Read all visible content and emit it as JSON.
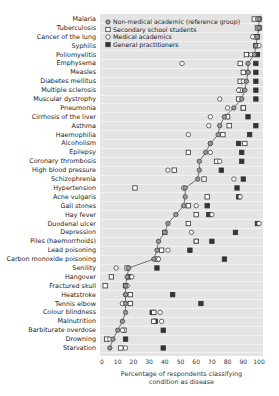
{
  "chart_data": {
    "type": "scatter",
    "title": "",
    "xlabel": "Percentage of respondents classifying condition as disease",
    "ylabel": "",
    "xlim": [
      0,
      100
    ],
    "x_ticks": [
      "0",
      "10",
      "20",
      "30",
      "40",
      "50",
      "60",
      "70",
      "80",
      "90",
      "100"
    ],
    "grid": true,
    "legend_position": "upper-left-inside",
    "categories": [
      "Malaria",
      "Tuberculosis",
      "Cancer of the lung",
      "Syphilis",
      "Poliomyelitis",
      "Emphysema",
      "Measles",
      "Diabetes mellitus",
      "Multiple sclerosis",
      "Muscular dystrophy",
      "Pneumonia",
      "Cirrhosis of the liver",
      "Asthma",
      "Haemophilia",
      "Alcoholism",
      "Epilepsy",
      "Coronary thrombosis",
      "High blood pressure",
      "Schizophrenia",
      "Hypertension",
      "Acne vulgaris",
      "Gall stones",
      "Hay fever",
      "Duodenal ulcer",
      "Depression",
      "Piles (haemorrhoids)",
      "Lead poisoning",
      "Carbon monoxide poisoning",
      "Senility",
      "Hangover",
      "Fractured skull",
      "Heatstroke",
      "Tennis elbow",
      "Colour blindness",
      "Malnutrition",
      "Barbiturate overdose",
      "Drowning",
      "Starvation"
    ],
    "series": [
      {
        "name": "Non-medical academic (reference group)",
        "marker": "circle-dot",
        "connected": true,
        "values": [
          100,
          100,
          99,
          98,
          97,
          93,
          93,
          92,
          91,
          89,
          84,
          78,
          75,
          74,
          69,
          66,
          62,
          62,
          61,
          53,
          53,
          52,
          47,
          42,
          40,
          36,
          35,
          33,
          17,
          16,
          15,
          15,
          15,
          15,
          13,
          10,
          7,
          5
        ]
      },
      {
        "name": "Secondary school students",
        "marker": "open-square",
        "values": [
          97,
          99,
          98,
          98,
          92,
          88,
          90,
          88,
          88,
          87,
          90,
          80,
          81,
          77,
          91,
          55,
          73,
          46,
          65,
          21,
          67,
          55,
          60,
          55,
          40,
          60,
          38,
          35,
          16,
          6,
          2,
          18,
          18,
          33,
          33,
          14,
          3,
          12
        ]
      },
      {
        "name": "Medical academics",
        "marker": "open-circle",
        "values": [
          99,
          100,
          96,
          100,
          95,
          51,
          93,
          90,
          87,
          75,
          80,
          69,
          68,
          55,
          69,
          69,
          75,
          42,
          84,
          52,
          88,
          60,
          70,
          100,
          57,
          60,
          42,
          36,
          9,
          19,
          16,
          15,
          13,
          37,
          38,
          13,
          5,
          15
        ]
      },
      {
        "name": "General practitioners",
        "marker": "filled-square",
        "values": [
          100,
          100,
          99,
          98,
          99,
          98,
          98,
          98,
          98,
          98,
          90,
          93,
          98,
          94,
          87,
          89,
          89,
          76,
          90,
          86,
          87,
          67,
          68,
          99,
          85,
          70,
          56,
          78,
          35,
          17,
          15,
          45,
          63,
          32,
          34,
          39,
          15,
          39
        ]
      }
    ]
  },
  "legend": [
    {
      "label": "Non-medical academic (reference group)",
      "icon": "circle-dot-icon"
    },
    {
      "label": "Secondary school students",
      "icon": "open-square-icon"
    },
    {
      "label": "Medical academics",
      "icon": "open-circle-icon"
    },
    {
      "label": "General practitioners",
      "icon": "filled-square-icon"
    }
  ],
  "axis": {
    "label_line1": "Percentage of respondents classifying",
    "label_line2": "condition as disease"
  }
}
